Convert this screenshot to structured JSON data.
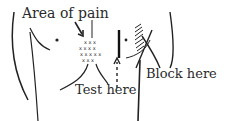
{
  "diagram": {
    "labels": {
      "area_of_pain": "Area of pain",
      "test_here": "Test here",
      "block_here": "Block here"
    },
    "markers": {
      "pain_mark": "x",
      "nipple_mark": "•"
    },
    "colors": {
      "ink": "#222222",
      "background": "#ffffff"
    }
  }
}
